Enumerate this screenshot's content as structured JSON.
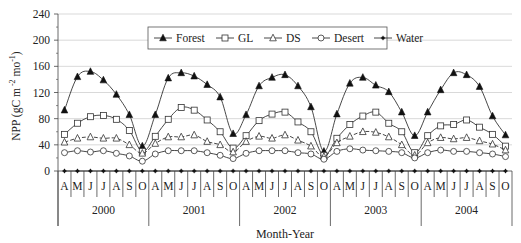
{
  "chart_data": {
    "type": "line",
    "title": "",
    "xlabel": "Month-Year",
    "ylabel": "NPP (gC m⁻² mo⁻¹)",
    "ylabel_parts": {
      "main": "NPP (gC m",
      "sup1": " -2",
      "mid": " mo",
      "sup2": "-1",
      "end": ")"
    },
    "ylim": [
      0,
      240
    ],
    "yticks": [
      0,
      40,
      80,
      120,
      160,
      200,
      240
    ],
    "grid": "horizontal",
    "legend_position": "top-inside",
    "months": [
      "A",
      "M",
      "J",
      "J",
      "A",
      "S",
      "O"
    ],
    "years": [
      "2000",
      "2001",
      "2002",
      "2003",
      "2004"
    ],
    "categories": [
      "A-2000",
      "M-2000",
      "J-2000",
      "J-2000",
      "A-2000",
      "S-2000",
      "O-2000",
      "A-2001",
      "M-2001",
      "J-2001",
      "J-2001",
      "A-2001",
      "S-2001",
      "O-2001",
      "A-2002",
      "M-2002",
      "J-2002",
      "J-2002",
      "A-2002",
      "S-2002",
      "O-2002",
      "A-2003",
      "M-2003",
      "J-2003",
      "J-2003",
      "A-2003",
      "S-2003",
      "O-2003",
      "A-2004",
      "M-2004",
      "J-2004",
      "J-2004",
      "A-2004",
      "S-2004",
      "O-2004"
    ],
    "series": [
      {
        "name": "Forest",
        "marker": "triangle-filled",
        "values": [
          93,
          144,
          152,
          139,
          117,
          86,
          38,
          86,
          142,
          150,
          145,
          132,
          113,
          57,
          86,
          130,
          143,
          147,
          130,
          98,
          30,
          87,
          134,
          143,
          131,
          121,
          90,
          54,
          90,
          124,
          150,
          147,
          129,
          84,
          55
        ]
      },
      {
        "name": "GL",
        "marker": "square-open",
        "values": [
          56,
          73,
          83,
          85,
          79,
          62,
          30,
          53,
          79,
          97,
          93,
          78,
          60,
          35,
          54,
          77,
          87,
          90,
          75,
          60,
          24,
          50,
          71,
          84,
          90,
          73,
          60,
          28,
          54,
          69,
          71,
          78,
          67,
          56,
          38
        ]
      },
      {
        "name": "DS",
        "marker": "triangle-open",
        "values": [
          44,
          50,
          52,
          50,
          50,
          40,
          27,
          42,
          52,
          52,
          55,
          45,
          40,
          29,
          45,
          53,
          50,
          55,
          47,
          38,
          22,
          43,
          53,
          60,
          59,
          52,
          40,
          24,
          43,
          51,
          49,
          51,
          46,
          41,
          32
        ]
      },
      {
        "name": "Desert",
        "marker": "circle-open",
        "values": [
          28,
          31,
          29,
          31,
          27,
          23,
          15,
          26,
          31,
          31,
          31,
          28,
          24,
          19,
          27,
          31,
          31,
          31,
          28,
          26,
          18,
          30,
          34,
          32,
          31,
          30,
          28,
          20,
          28,
          32,
          30,
          30,
          28,
          26,
          22
        ]
      },
      {
        "name": "Water",
        "marker": "star",
        "values": [
          0,
          0,
          0,
          0,
          0,
          0,
          0,
          0,
          0,
          0,
          0,
          0,
          0,
          0,
          0,
          0,
          0,
          0,
          0,
          0,
          0,
          0,
          0,
          0,
          0,
          0,
          0,
          0,
          0,
          0,
          0,
          0,
          0,
          0,
          0
        ]
      }
    ]
  },
  "colors": {
    "line": "#333333",
    "grid": "#cfcfcf",
    "axis": "#444444",
    "text": "#222222"
  }
}
